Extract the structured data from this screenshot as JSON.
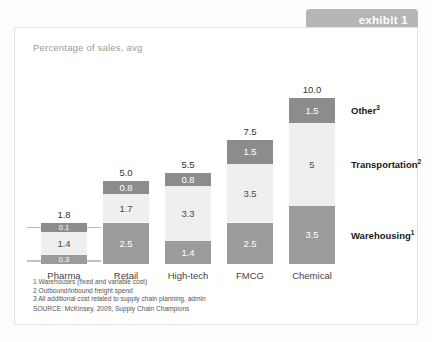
{
  "exhibit": {
    "label": "exhibit 1"
  },
  "chart_data": {
    "type": "bar",
    "subtype": "stacked-bar",
    "title": "",
    "subtitle": "Percentage of sales, avg",
    "xlabel": "",
    "ylabel": "",
    "grid": false,
    "legend_position": "right",
    "categories": [
      "Pharma",
      "Retail",
      "High-tech",
      "FMCG",
      "Chemical"
    ],
    "totals": [
      "1.8",
      "5.0",
      "5.5",
      "7.5",
      "10.0"
    ],
    "totals_numeric": [
      1.8,
      5.0,
      5.5,
      7.5,
      10.0
    ],
    "series": [
      {
        "name": "Other",
        "footnote": "3",
        "values": [
          0.1,
          0.8,
          0.8,
          1.5,
          1.5
        ],
        "labels": [
          "0.1",
          "0.8",
          "0.8",
          "1.5",
          "1.5"
        ],
        "color": "#8c8c8c"
      },
      {
        "name": "Transportation",
        "footnote": "2",
        "values": [
          1.4,
          1.7,
          3.3,
          3.5,
          5.0
        ],
        "labels": [
          "1.4",
          "1.7",
          "3.3",
          "3.5",
          "5"
        ],
        "color": "#efefef"
      },
      {
        "name": "Warehousing",
        "footnote": "1",
        "values": [
          0.3,
          2.5,
          1.4,
          2.5,
          3.5
        ],
        "labels": [
          "0.3",
          "2.5",
          "1.4",
          "2.5",
          "3.5"
        ],
        "color": "#9b9b9b"
      }
    ],
    "ylim": [
      0,
      10
    ]
  },
  "series_labels": [
    {
      "text": "Other",
      "sup": "3"
    },
    {
      "text": "Transportation",
      "sup": "2"
    },
    {
      "text": "Warehousing",
      "sup": "1"
    }
  ],
  "footnotes": [
    "1 Warehouses (fixed and variable cost)",
    "2 Outbound/inbound freight spend",
    "3 All additional cost related to supply chain planning, admin"
  ],
  "source": "SOURCE: McKinsey, 2009, Supply Chain Champions",
  "colors": {
    "other": "#8c8c8c",
    "transportation": "#efefef",
    "warehousing": "#9b9b9b",
    "tab": "#b6b6b6",
    "frame": "#e3e3e3"
  }
}
